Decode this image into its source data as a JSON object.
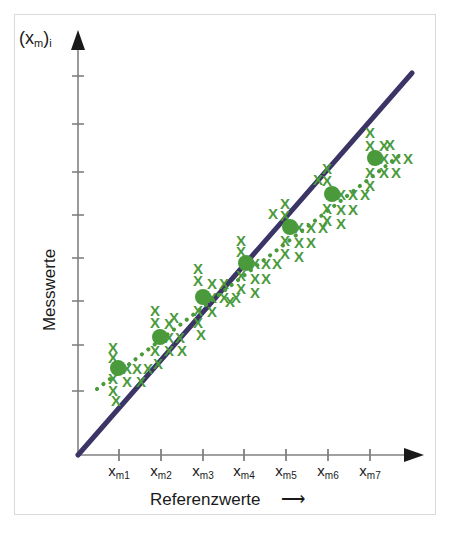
{
  "figure": {
    "background": "#ffffff",
    "frame_color": "#d9d9d9",
    "width": 452,
    "height": 537
  },
  "labels": {
    "y_axis_top": "(x",
    "y_axis_top_sub": "m",
    "y_axis_top_tail": ")",
    "y_axis_top_sub2": "i",
    "y_axis_side": "Messwerte",
    "x_axis_bottom": "Referenzwerte",
    "arrow_glyph": "⟶"
  },
  "chart_data": {
    "type": "scatter",
    "title": "",
    "xlabel": "Referenzwerte",
    "ylabel": "Messwerte",
    "y_axis_symbol": "(x_m)_i",
    "grid": false,
    "legend": "none",
    "axis_color": "#808080",
    "identity_line": {
      "label": "Identitaetsgerade",
      "color": "#3b3566",
      "width": 5,
      "style": "solid",
      "x_start": 78,
      "y_start": 455,
      "x_end": 412,
      "y_end": 73
    },
    "regression_line": {
      "label": "Regressionsgerade",
      "color": "#4a9a3c",
      "width": 4,
      "style": "dotted",
      "points": [
        [
          97,
          389
        ],
        [
          400,
          155
        ]
      ]
    },
    "categories": [
      "x_m1",
      "x_m2",
      "x_m3",
      "x_m4",
      "x_m5",
      "x_m6",
      "x_m7"
    ],
    "category_labels": [
      {
        "base": "x",
        "sub": "m1"
      },
      {
        "base": "x",
        "sub": "m2"
      },
      {
        "base": "x",
        "sub": "m3"
      },
      {
        "base": "x",
        "sub": "m4"
      },
      {
        "base": "x",
        "sub": "m5"
      },
      {
        "base": "x",
        "sub": "m6"
      },
      {
        "base": "x",
        "sub": "m7"
      }
    ],
    "x_tick_pixels": [
      119,
      161,
      203,
      244,
      286,
      328,
      370
    ],
    "y_tick_pixels": [
      76,
      124,
      172,
      215,
      258,
      301,
      345,
      391
    ],
    "marker": {
      "glyph": "X",
      "color": "#4a9a3c",
      "size": 15
    },
    "mean_marker": {
      "shape": "circle",
      "color": "#4a9a3c",
      "radius": 8,
      "label": "Mittelwert"
    },
    "clusters": [
      {
        "name": "x_m1",
        "mean_px": [
          118,
          368
        ],
        "points_px": [
          [
            113,
            347
          ],
          [
            113,
            357
          ],
          [
            113,
            378
          ],
          [
            113,
            390
          ],
          [
            127,
            368
          ],
          [
            137,
            368
          ],
          [
            148,
            368
          ],
          [
            127,
            381
          ],
          [
            141,
            381
          ],
          [
            116,
            400
          ]
        ]
      },
      {
        "name": "x_m2",
        "mean_px": [
          160,
          337
        ],
        "points_px": [
          [
            155,
            310
          ],
          [
            155,
            322
          ],
          [
            155,
            350
          ],
          [
            169,
            337
          ],
          [
            180,
            337
          ],
          [
            169,
            323
          ],
          [
            174,
            317
          ],
          [
            169,
            350
          ],
          [
            182,
            350
          ],
          [
            158,
            363
          ]
        ]
      },
      {
        "name": "x_m3",
        "mean_px": [
          203,
          297
        ],
        "points_px": [
          [
            198,
            268
          ],
          [
            198,
            280
          ],
          [
            198,
            310
          ],
          [
            198,
            322
          ],
          [
            212,
            297
          ],
          [
            224,
            297
          ],
          [
            236,
            297
          ],
          [
            212,
            283
          ],
          [
            224,
            283
          ],
          [
            212,
            311
          ],
          [
            201,
            334
          ]
        ]
      },
      {
        "name": "x_m4",
        "mean_px": [
          246,
          263
        ],
        "points_px": [
          [
            241,
            240
          ],
          [
            241,
            251
          ],
          [
            241,
            275
          ],
          [
            241,
            288
          ],
          [
            255,
            263
          ],
          [
            266,
            263
          ],
          [
            277,
            263
          ],
          [
            255,
            278
          ],
          [
            266,
            278
          ],
          [
            255,
            292
          ],
          [
            230,
            301
          ]
        ]
      },
      {
        "name": "x_m5",
        "mean_px": [
          290,
          227
        ],
        "points_px": [
          [
            285,
            203
          ],
          [
            285,
            215
          ],
          [
            285,
            240
          ],
          [
            285,
            253
          ],
          [
            299,
            227
          ],
          [
            311,
            227
          ],
          [
            323,
            227
          ],
          [
            299,
            242
          ],
          [
            311,
            242
          ],
          [
            299,
            256
          ],
          [
            273,
            213
          ]
        ]
      },
      {
        "name": "x_m6",
        "mean_px": [
          332,
          194
        ],
        "points_px": [
          [
            327,
            168
          ],
          [
            327,
            180
          ],
          [
            327,
            208
          ],
          [
            327,
            220
          ],
          [
            341,
            194
          ],
          [
            353,
            194
          ],
          [
            365,
            194
          ],
          [
            341,
            209
          ],
          [
            353,
            209
          ],
          [
            341,
            223
          ],
          [
            318,
            179
          ]
        ]
      },
      {
        "name": "x_m7",
        "mean_px": [
          375,
          158
        ],
        "points_px": [
          [
            370,
            132
          ],
          [
            370,
            145
          ],
          [
            370,
            172
          ],
          [
            370,
            185
          ],
          [
            384,
            158
          ],
          [
            396,
            158
          ],
          [
            408,
            158
          ],
          [
            384,
            172
          ],
          [
            396,
            172
          ],
          [
            384,
            145
          ],
          [
            390,
            144
          ]
        ]
      }
    ]
  }
}
